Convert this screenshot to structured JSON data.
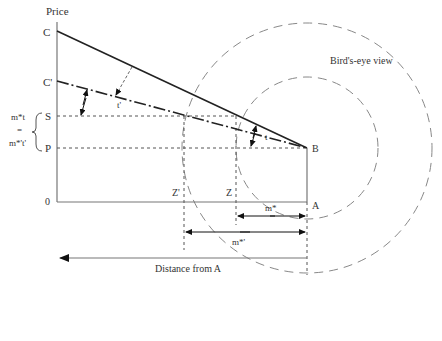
{
  "diagram": {
    "axis": {
      "y_label": "Price",
      "x_label": "Distance from A",
      "origin": "0"
    },
    "points": {
      "C": "C",
      "C_prime": "C'",
      "S": "S",
      "P": "P",
      "B": "B",
      "A": "A",
      "Z": "Z",
      "Z_prime": "Z'"
    },
    "brace_label": {
      "top": "m*t",
      "mid": "=",
      "bottom": "m*'t'"
    },
    "slope_labels": {
      "t": "t",
      "t_prime": "t'"
    },
    "distance_labels": {
      "m_star": "m*",
      "m_star_prime": "m*'"
    },
    "birds_eye_label": "Bird's-eye view"
  }
}
